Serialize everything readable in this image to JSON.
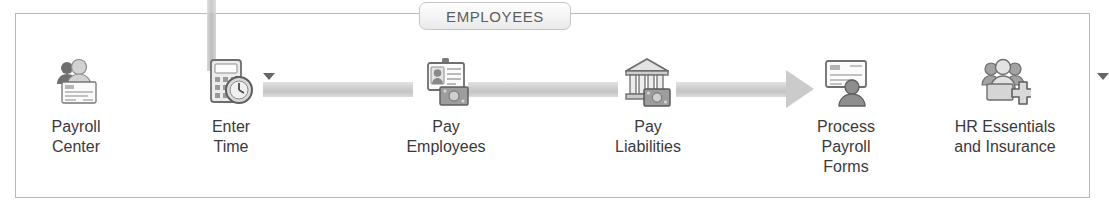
{
  "window": {
    "tab_label": "EMPLOYEES",
    "border_color": "#b9b9b9",
    "connector_color": "#cbcbcb",
    "text_color": "#3a3a3a",
    "tab_text_color": "#5d5d5d"
  },
  "workflow": {
    "name": "Employees workflow ribbon",
    "items": [
      {
        "id": "payroll-center",
        "label": "Payroll\nCenter",
        "icon": "payroll-center-icon",
        "has_dropdown": false
      },
      {
        "id": "enter-time",
        "label": "Enter\nTime",
        "icon": "enter-time-icon",
        "has_dropdown": true
      },
      {
        "id": "pay-employees",
        "label": "Pay\nEmployees",
        "icon": "pay-employees-icon",
        "has_dropdown": false
      },
      {
        "id": "pay-liabilities",
        "label": "Pay\nLiabilities",
        "icon": "pay-liabilities-icon",
        "has_dropdown": false
      },
      {
        "id": "process-payroll-forms",
        "label": "Process\nPayroll\nForms",
        "icon": "process-payroll-forms-icon",
        "has_dropdown": false
      },
      {
        "id": "hr-essentials-and-insurance",
        "label": "HR Essentials\nand Insurance",
        "icon": "hr-essentials-icon",
        "has_dropdown": true
      }
    ]
  }
}
